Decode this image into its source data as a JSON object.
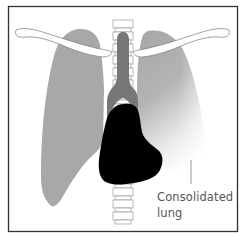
{
  "diagram": {
    "label": {
      "line1": "Consolidated",
      "line2": "lung"
    },
    "parts": [
      "right-lung",
      "left-lung",
      "trachea",
      "spine",
      "clavicle-left",
      "clavicle-right",
      "heart",
      "consolidated-region"
    ],
    "colors": {
      "frame": "#333333",
      "lung": "#a9a9a9",
      "trachea": "#7a7a7a",
      "heart": "#000000",
      "bone_outline": "#8a8a8a",
      "label_text": "#555555"
    }
  }
}
